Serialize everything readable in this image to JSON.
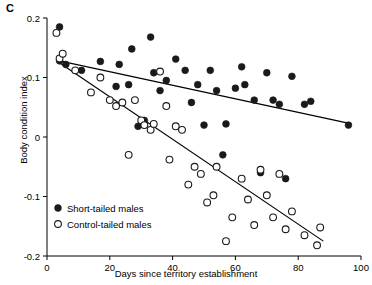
{
  "figure": {
    "panel_label": "C",
    "xlabel": "Days since territory establishment",
    "ylabel": "Body condition index"
  },
  "chart_data": {
    "type": "scatter",
    "title": "",
    "xlabel": "Days since territory establishment",
    "ylabel": "Body condition index",
    "xlim": [
      0,
      100
    ],
    "ylim": [
      -0.2,
      0.2
    ],
    "xticks": [
      0,
      20,
      40,
      60,
      80,
      100
    ],
    "xticklabels": [
      "0",
      "20",
      "40",
      "60",
      "80",
      "100"
    ],
    "yticks": [
      -0.2,
      -0.1,
      0,
      0.1,
      0.2
    ],
    "yticklabels": [
      "-0.2",
      "-0.1",
      "0",
      "0.1",
      "0.2"
    ],
    "grid": false,
    "legend_position": "bottom-left",
    "series": [
      {
        "name": "Short-tailed males",
        "marker": "filled-circle",
        "color": "#1a1a1a",
        "points": [
          [
            4,
            0.185
          ],
          [
            4,
            0.128
          ],
          [
            6,
            0.122
          ],
          [
            11,
            0.112
          ],
          [
            17,
            0.127
          ],
          [
            22,
            0.085
          ],
          [
            23,
            0.122
          ],
          [
            26,
            0.088
          ],
          [
            27,
            0.148
          ],
          [
            29,
            0.018
          ],
          [
            31,
            0.028
          ],
          [
            33,
            0.168
          ],
          [
            34,
            0.108
          ],
          [
            36,
            0.078
          ],
          [
            38,
            0.095
          ],
          [
            41,
            0.131
          ],
          [
            44,
            0.112
          ],
          [
            46,
            0.058
          ],
          [
            48,
            0.088
          ],
          [
            50,
            0.02
          ],
          [
            52,
            0.112
          ],
          [
            54,
            0.078
          ],
          [
            56,
            -0.03
          ],
          [
            57,
            0.022
          ],
          [
            60,
            0.082
          ],
          [
            62,
            0.118
          ],
          [
            63,
            0.088
          ],
          [
            66,
            0.062
          ],
          [
            68,
            -0.06
          ],
          [
            70,
            0.108
          ],
          [
            72,
            0.062
          ],
          [
            74,
            0.055
          ],
          [
            76,
            -0.07
          ],
          [
            78,
            0.102
          ],
          [
            82,
            0.055
          ],
          [
            84,
            0.06
          ],
          [
            96,
            0.02
          ]
        ]
      },
      {
        "name": "Control-tailed males",
        "marker": "open-circle",
        "color": "#1a1a1a",
        "points": [
          [
            3,
            0.175
          ],
          [
            4,
            0.132
          ],
          [
            5,
            0.14
          ],
          [
            9,
            0.112
          ],
          [
            14,
            0.075
          ],
          [
            17,
            0.1
          ],
          [
            20,
            0.062
          ],
          [
            22,
            0.052
          ],
          [
            24,
            0.058
          ],
          [
            26,
            -0.03
          ],
          [
            28,
            0.062
          ],
          [
            30,
            0.028
          ],
          [
            31,
            0.02
          ],
          [
            33,
            0.012
          ],
          [
            34,
            0.022
          ],
          [
            36,
            0.11
          ],
          [
            38,
            0.052
          ],
          [
            39,
            -0.038
          ],
          [
            41,
            0.018
          ],
          [
            43,
            0.012
          ],
          [
            45,
            -0.08
          ],
          [
            47,
            -0.05
          ],
          [
            49,
            -0.062
          ],
          [
            51,
            -0.11
          ],
          [
            53,
            -0.098
          ],
          [
            54,
            -0.05
          ],
          [
            57,
            -0.175
          ],
          [
            59,
            -0.135
          ],
          [
            62,
            -0.07
          ],
          [
            64,
            -0.105
          ],
          [
            66,
            -0.148
          ],
          [
            68,
            -0.055
          ],
          [
            70,
            -0.098
          ],
          [
            72,
            -0.135
          ],
          [
            74,
            -0.062
          ],
          [
            76,
            -0.155
          ],
          [
            78,
            -0.125
          ],
          [
            82,
            -0.165
          ],
          [
            86,
            -0.182
          ],
          [
            87,
            -0.152
          ]
        ]
      }
    ],
    "fit_lines": [
      {
        "name": "Short-tailed males fit",
        "x": [
          4,
          97
        ],
        "y": [
          0.128,
          0.022
        ]
      },
      {
        "name": "Control-tailed males fit",
        "x": [
          3,
          88
        ],
        "y": [
          0.128,
          -0.175
        ]
      }
    ],
    "legend": [
      {
        "label": "Short-tailed males",
        "marker": "filled-circle"
      },
      {
        "label": "Control-tailed males",
        "marker": "open-circle"
      }
    ]
  }
}
